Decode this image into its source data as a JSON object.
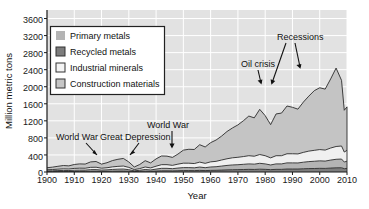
{
  "chart_data": {
    "type": "area",
    "title": "",
    "subtitle": "",
    "xlabel": "Year",
    "ylabel": "Million metric tons",
    "xlim": [
      1900,
      2010
    ],
    "ylim": [
      0,
      3800
    ],
    "yticks": [
      0,
      400,
      800,
      1200,
      1600,
      2000,
      2400,
      2800,
      3200,
      3600
    ],
    "xticks": [
      1900,
      1910,
      1920,
      1930,
      1940,
      1950,
      1960,
      1970,
      1980,
      1990,
      2000,
      2010
    ],
    "ytick_labels": [
      "0",
      "400",
      "800",
      "1200",
      "1600",
      "2000",
      "2400",
      "2800",
      "3200",
      "3600"
    ],
    "xtick_labels": [
      "1900",
      "1910",
      "1920",
      "1930",
      "1940",
      "1950",
      "1960",
      "1970",
      "1980",
      "1990",
      "2000",
      "2010"
    ],
    "grid": true,
    "grid_color": "#ffffff",
    "plot_background": "#e2e2e2",
    "stacked": true,
    "legend_position": "upper-left",
    "x": [
      1900,
      1902,
      1904,
      1906,
      1908,
      1910,
      1912,
      1914,
      1916,
      1918,
      1920,
      1922,
      1924,
      1926,
      1928,
      1930,
      1932,
      1934,
      1936,
      1938,
      1940,
      1942,
      1944,
      1946,
      1948,
      1950,
      1952,
      1954,
      1956,
      1958,
      1960,
      1962,
      1964,
      1966,
      1968,
      1970,
      1972,
      1974,
      1976,
      1978,
      1980,
      1982,
      1984,
      1986,
      1988,
      1990,
      1992,
      1994,
      1996,
      1998,
      2000,
      2002,
      2004,
      2006,
      2008,
      2009,
      2010
    ],
    "series": [
      {
        "name": "Recycled metals",
        "color": "#7d7d7d",
        "values": [
          8,
          9,
          10,
          11,
          11,
          13,
          14,
          14,
          17,
          18,
          15,
          16,
          19,
          21,
          22,
          18,
          10,
          14,
          19,
          16,
          22,
          28,
          28,
          26,
          30,
          33,
          33,
          32,
          38,
          33,
          38,
          40,
          45,
          50,
          53,
          55,
          58,
          62,
          60,
          66,
          62,
          55,
          62,
          62,
          70,
          70,
          70,
          76,
          80,
          82,
          86,
          84,
          92,
          98,
          100,
          78,
          84
        ]
      },
      {
        "name": "Primary metals",
        "color": "#b4b4b4",
        "values": [
          18,
          20,
          23,
          26,
          24,
          29,
          31,
          30,
          38,
          38,
          30,
          34,
          41,
          45,
          48,
          36,
          18,
          26,
          40,
          32,
          46,
          58,
          58,
          52,
          62,
          70,
          70,
          66,
          78,
          68,
          80,
          84,
          94,
          104,
          112,
          116,
          122,
          128,
          124,
          138,
          128,
          110,
          128,
          128,
          144,
          144,
          142,
          154,
          164,
          170,
          176,
          172,
          188,
          200,
          204,
          156,
          170
        ]
      },
      {
        "name": "Industrial minerals",
        "color": "#f0f0f0",
        "values": [
          26,
          29,
          33,
          37,
          35,
          42,
          45,
          44,
          54,
          56,
          44,
          50,
          60,
          66,
          70,
          54,
          28,
          40,
          58,
          48,
          68,
          86,
          86,
          78,
          92,
          104,
          104,
          100,
          116,
          102,
          120,
          126,
          142,
          156,
          168,
          174,
          182,
          192,
          186,
          206,
          192,
          166,
          192,
          192,
          214,
          214,
          212,
          230,
          246,
          256,
          264,
          258,
          282,
          300,
          306,
          234,
          254
        ]
      },
      {
        "name": "Construction materials",
        "color": "#c4c4c4",
        "values": [
          48,
          56,
          68,
          78,
          74,
          92,
          100,
          98,
          128,
          134,
          96,
          118,
          148,
          166,
          178,
          128,
          62,
          96,
          148,
          118,
          172,
          204,
          200,
          186,
          236,
          306,
          326,
          330,
          408,
          384,
          450,
          500,
          560,
          640,
          700,
          760,
          840,
          930,
          900,
          1060,
          940,
          780,
          980,
          1000,
          1120,
          1090,
          1050,
          1180,
          1290,
          1400,
          1450,
          1430,
          1620,
          1840,
          1540,
          980,
          1020
        ]
      }
    ],
    "total_curve": [
      100,
      114,
      134,
      152,
      144,
      176,
      190,
      186,
      237,
      246,
      185,
      218,
      268,
      298,
      318,
      236,
      118,
      176,
      265,
      214,
      308,
      376,
      372,
      342,
      420,
      513,
      533,
      528,
      640,
      587,
      688,
      750,
      841,
      950,
      1033,
      1105,
      1202,
      1312,
      1270,
      1470,
      1322,
      1111,
      1362,
      1382,
      1548,
      1518,
      1474,
      1640,
      1780,
      1908,
      1976,
      1944,
      2182,
      2438,
      2150,
      1448,
      1528
    ],
    "annotations": [
      {
        "label": "World War",
        "x": 1917,
        "note": "WWI trough/peak around 1917"
      },
      {
        "label": "Great Depression",
        "x": 1932,
        "note": "sharp drop in early 1930s"
      },
      {
        "label": "World War",
        "x": 1945,
        "note": "WWII dip around 1944-46"
      },
      {
        "label": "Oil crisis",
        "x": 1975,
        "note": "dip in mid 1970s"
      },
      {
        "label": "Recessions",
        "x": 1982,
        "note": "dips around 1982 and 1991"
      }
    ],
    "legend_entries": [
      {
        "label": "Primary metals",
        "swatch": "#b4b4b4",
        "border": "none"
      },
      {
        "label": "Recycled metals",
        "swatch": "#7d7d7d",
        "border": "#333333"
      },
      {
        "label": "Industrial minerals",
        "swatch": "#f4f4f4",
        "border": "#333333"
      },
      {
        "label": "Construction materials",
        "swatch": "#c6c6c6",
        "border": "#333333"
      }
    ]
  },
  "axes": {
    "ylabel": "Million metric tons",
    "xlabel": "Year",
    "ytick_0": "0",
    "ytick_400": "400",
    "ytick_800": "800",
    "ytick_1200": "1200",
    "ytick_1600": "1600",
    "ytick_2000": "2000",
    "ytick_2400": "2400",
    "ytick_2800": "2800",
    "ytick_3200": "3200",
    "ytick_3600": "3600",
    "xtick_1900": "1900",
    "xtick_1910": "1910",
    "xtick_1920": "1920",
    "xtick_1930": "1930",
    "xtick_1940": "1940",
    "xtick_1950": "1950",
    "xtick_1960": "1960",
    "xtick_1970": "1970",
    "xtick_1980": "1980",
    "xtick_1990": "1990",
    "xtick_2000": "2000",
    "xtick_2010": "2010"
  },
  "legend": {
    "item0": "Primary metals",
    "item1": "Recycled metals",
    "item2": "Industrial minerals",
    "item3": "Construction materials"
  },
  "annotations": {
    "world_war_1": "World War",
    "great_depression": "Great Depression",
    "world_war_2": "World War",
    "oil_crisis": "Oil crisis",
    "recessions": "Recessions"
  },
  "colors": {
    "plot_bg": "#e2e2e2",
    "grid": "#ffffff",
    "axis_line": "#1a1a1a",
    "primary_metals": "#b4b4b4",
    "recycled_metals": "#7d7d7d",
    "industrial_minerals": "#f0f0f0",
    "construction_materials": "#c4c4c4",
    "text": "#111111"
  }
}
